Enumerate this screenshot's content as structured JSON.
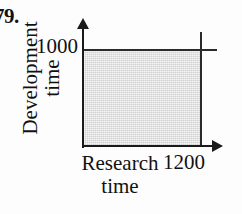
{
  "figure": {
    "problem_number": "79."
  },
  "chart_data": {
    "type": "area",
    "title": "",
    "xlabel_lines": [
      "Research",
      "time"
    ],
    "ylabel_lines": [
      "Development",
      "time"
    ],
    "x_tick_labels": [
      "1200"
    ],
    "y_tick_labels": [
      "1000"
    ],
    "xlim": [
      0,
      1200
    ],
    "ylim": [
      0,
      1000
    ],
    "grid": false,
    "legend": "none",
    "shaded_region": {
      "description": "feasible region rectangle",
      "x_range": [
        0,
        1200
      ],
      "y_range": [
        0,
        1000
      ],
      "fill_color": "#cfcfcf"
    },
    "constraint_lines": [
      {
        "orientation": "horizontal",
        "value": 1000,
        "label": "1000"
      },
      {
        "orientation": "vertical",
        "value": 1200,
        "label": "1200"
      }
    ],
    "axis_color": "#1a1a1a"
  },
  "axes": {
    "y_tick": "1000",
    "x_tick": "1200",
    "y_title_line1": "Development",
    "y_title_line2": "time",
    "x_title_line1": "Research",
    "x_title_line2": "time"
  }
}
